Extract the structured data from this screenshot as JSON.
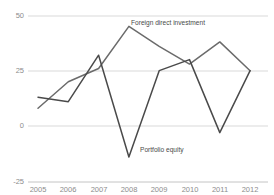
{
  "chart_data": {
    "type": "line",
    "title": "",
    "subtitle": "",
    "xlabel": "",
    "ylabel": "",
    "categories": [
      "2005",
      "2006",
      "2007",
      "2008",
      "2009",
      "2010",
      "2011",
      "2012"
    ],
    "x": [
      2005,
      2006,
      2007,
      2008,
      2009,
      2010,
      2011,
      2012
    ],
    "ylim": [
      -25,
      50
    ],
    "yticks": [
      50,
      25,
      0,
      -25
    ],
    "ytick_labels": [
      "50",
      "25",
      "0",
      "-25"
    ],
    "grid": true,
    "grid_axis": "y",
    "legend": "inline-annotations",
    "series": [
      {
        "name": "Foreign direct investment",
        "color": "#6b6b6b",
        "values": [
          8,
          20,
          26,
          45,
          36,
          28,
          38,
          25
        ],
        "annotation": {
          "label": "Foreign direct investment",
          "x": 2008,
          "y": 45
        }
      },
      {
        "name": "Portfolio equity",
        "color": "#4a4a4a",
        "values": [
          13,
          11,
          32,
          -14,
          25,
          30,
          -3,
          25
        ],
        "annotation": {
          "label": "Portfolio equity",
          "x": 2008,
          "y": -14
        }
      }
    ]
  },
  "annotations": {
    "fdi_label": "Foreign direct investment",
    "portfolio_label": "Portfolio equity"
  },
  "axis": {
    "y_labels": [
      "50",
      "25",
      "0",
      "-25"
    ],
    "x_labels": [
      "2005",
      "2006",
      "2007",
      "2008",
      "2009",
      "2010",
      "2011",
      "2012"
    ]
  },
  "clipped_header": "",
  "colors": {
    "fdi": "#6b6b6b",
    "portfolio": "#4a4a4a",
    "gridline": "#c9c9c9",
    "tick_text": "#8c8c8c",
    "background": "#ffffff"
  }
}
